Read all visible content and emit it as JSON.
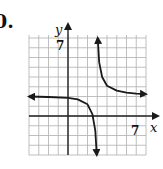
{
  "problem": {
    "number_label": "0."
  },
  "chart_data": {
    "type": "line",
    "title": "",
    "xlabel": "x",
    "ylabel": "y",
    "xlim": [
      -4,
      8
    ],
    "ylim": [
      -4,
      8
    ],
    "grid": true,
    "tick_labels": {
      "x": [
        "7"
      ],
      "y": [
        "7"
      ]
    },
    "asymptotes": {
      "vertical": 3,
      "horizontal": 2
    },
    "series": [
      {
        "name": "left-branch",
        "x": [
          -4,
          -2,
          0,
          1,
          2,
          2.5,
          2.8,
          2.95
        ],
        "y": [
          2.0,
          1.95,
          1.85,
          1.7,
          1.2,
          0.2,
          -1.5,
          -4
        ]
      },
      {
        "name": "right-branch",
        "x": [
          3.05,
          3.2,
          3.5,
          4,
          5,
          6,
          7,
          8
        ],
        "y": [
          8,
          5.5,
          4,
          3.1,
          2.6,
          2.4,
          2.3,
          2.25
        ]
      }
    ],
    "colors": {
      "curve": "#1a1a1a",
      "grid": "#b8b8b8",
      "axes": "#222222"
    }
  }
}
